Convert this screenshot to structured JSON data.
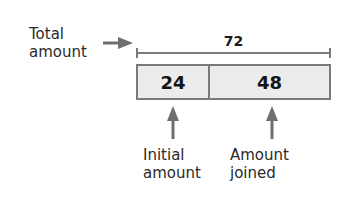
{
  "diagram": {
    "total_label": [
      "Total",
      "amount"
    ],
    "total_value": "72",
    "segments": [
      {
        "value": "24",
        "label": [
          "Initial",
          "amount"
        ]
      },
      {
        "value": "48",
        "label": [
          "Amount",
          "joined"
        ]
      }
    ],
    "colors": {
      "box_fill": "#ececec",
      "stroke": "#7a7a7a",
      "arrow": "#6e6e6e",
      "text": "#2a2a2a"
    }
  }
}
